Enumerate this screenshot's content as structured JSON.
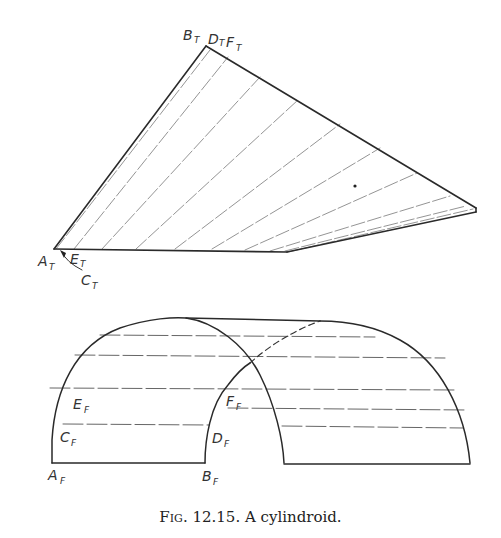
{
  "figure": {
    "caption_prefix": "Fig.",
    "caption_number": "12.15.",
    "caption_text": "A cylindroid."
  },
  "top_view": {
    "labels": {
      "B": {
        "letter": "B",
        "sub": "T"
      },
      "D": {
        "letter": "D",
        "sub": "T"
      },
      "F": {
        "letter": "F",
        "sub": "T"
      },
      "A": {
        "letter": "A",
        "sub": "T"
      },
      "E": {
        "letter": "E",
        "sub": "T"
      },
      "C": {
        "letter": "C",
        "sub": "T"
      }
    }
  },
  "front_view": {
    "labels": {
      "A": {
        "letter": "A",
        "sub": "F"
      },
      "B": {
        "letter": "B",
        "sub": "F"
      },
      "C": {
        "letter": "C",
        "sub": "F"
      },
      "D": {
        "letter": "D",
        "sub": "F"
      },
      "E": {
        "letter": "E",
        "sub": "F"
      },
      "F": {
        "letter": "F",
        "sub": "F"
      }
    }
  },
  "colors": {
    "line": "#333333",
    "hidden": "#555555",
    "element": "#777777"
  }
}
